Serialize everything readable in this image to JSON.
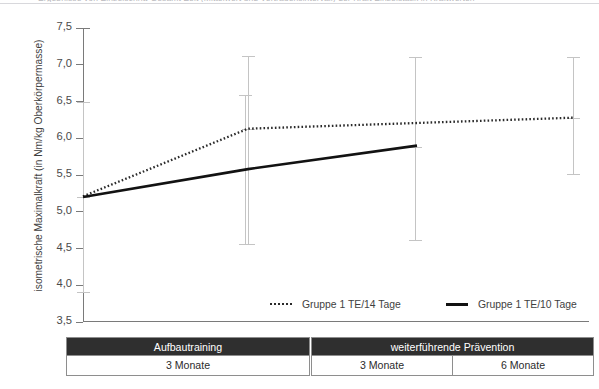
{
  "top_caption": "Ergebnisse von Einzelschritt-Gesamt-Zeit (Mittelwert und Vertrauensintervall) der Kraft Einzelstatik in Kraftwerten",
  "y_axis": {
    "title": "isometrische Maximalkraft (in Nm/kg Oberkörpermasse)",
    "ticks": [
      "7,5",
      "7,0",
      "6,5",
      "6,0",
      "5,5",
      "5,0",
      "4,5",
      "4,0",
      "3,5"
    ],
    "min": 3.5,
    "max": 7.5
  },
  "legend": {
    "items": [
      {
        "label": "Gruppe 1 TE/14 Tage",
        "style": "dotted",
        "color": "#2a2a2a"
      },
      {
        "label": "Gruppe 1 TE/10 Tage",
        "style": "solid",
        "color": "#121212"
      }
    ]
  },
  "phase_table": {
    "groups": [
      {
        "header": "Aufbautraining",
        "cells": [
          "3 Monate"
        ]
      },
      {
        "header": "weiterführende Prävention",
        "cells": [
          "3 Monate",
          "6 Monate"
        ]
      }
    ]
  },
  "chart_data": {
    "type": "line",
    "title": "",
    "xlabel": "",
    "ylabel": "isometrische Maximalkraft (in Nm/kg Oberkörpermasse)",
    "ylim": [
      3.5,
      7.5
    ],
    "ytick_step": 0.5,
    "grid": false,
    "legend_position": "bottom-right",
    "x": [
      "Aufbautraining 3 Monate",
      "weiterführende Prävention 3 Monate",
      "weiterführende Prävention 6 Monate"
    ],
    "series": [
      {
        "name": "Gruppe 1 TE/14 Tage",
        "style": "dotted",
        "color": "#2a2a2a",
        "values": [
          5.21,
          6.13,
          6.28
        ],
        "error_low": [
          3.91,
          4.56,
          5.52
        ],
        "error_high": [
          6.49,
          6.59,
          7.11
        ]
      },
      {
        "name": "Gruppe 1 TE/10 Tage",
        "style": "solid",
        "color": "#121212",
        "values": [
          5.2,
          5.58,
          5.9
        ],
        "error_low": [
          3.91,
          5.45,
          4.61
        ],
        "error_high": [
          6.49,
          7.1,
          7.1
        ]
      }
    ],
    "error_bars": [
      {
        "x_px": 83,
        "center": 5.2,
        "low": 3.91,
        "high": 6.49
      },
      {
        "x_px": 245,
        "center": 5.58,
        "low": 4.56,
        "high": 6.59
      },
      {
        "x_px": 248,
        "center": 6.13,
        "low": 4.56,
        "high": 7.12
      },
      {
        "x_px": 415,
        "center": 5.88,
        "low": 4.61,
        "high": 7.1
      },
      {
        "x_px": 573,
        "center": 6.28,
        "low": 5.52,
        "high": 7.11
      }
    ]
  }
}
